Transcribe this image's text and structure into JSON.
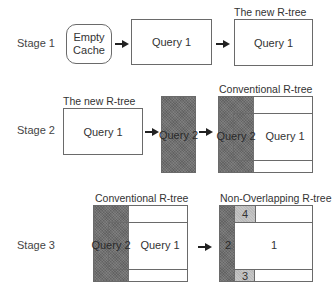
{
  "stages": [
    {
      "label": "Stage 1",
      "empty_cache": "Empty Cache",
      "query_box": "Query 1",
      "result_caption": "The new R-tree",
      "result_box": "Query 1"
    },
    {
      "label": "Stage 2",
      "input_caption": "The new R-tree",
      "input_box": "Query 1",
      "query_box": "Query 2",
      "result_caption": "Conventional R-tree",
      "result_query2": "Query 2",
      "result_query1": "Query 1"
    },
    {
      "label": "Stage 3",
      "input_caption": "Conventional R-tree",
      "input_query2": "Query 2",
      "input_query1": "Query 1",
      "result_caption": "Non-Overlapping R-tree",
      "regions": [
        "1",
        "2",
        "3",
        "4"
      ]
    }
  ],
  "colors": {
    "border": "#6a6a6a",
    "dark_shading": "#6f6f6f",
    "light_shading": "#b9b9b9",
    "arrow": "#222222"
  }
}
